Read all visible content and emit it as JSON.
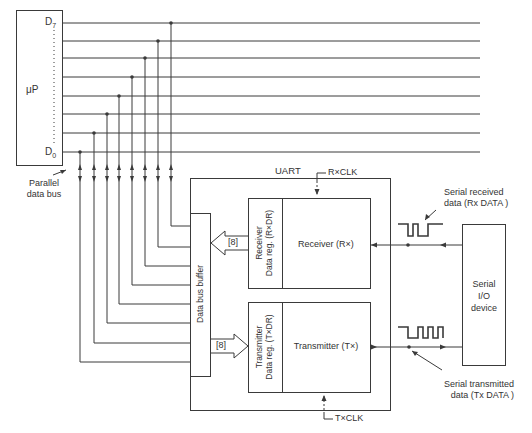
{
  "microprocessor": {
    "label": "μP",
    "pin_top": "D",
    "pin_top_sub": "7",
    "pin_bottom": "D",
    "pin_bottom_sub": "0"
  },
  "bus": {
    "lines": [
      "D7",
      "D6",
      "D5",
      "D4",
      "D3",
      "D2",
      "D1",
      "D0"
    ],
    "label_line1": "Parallel",
    "label_line2": "data bus"
  },
  "uart": {
    "title": "UART",
    "rx_clock": "R×CLK",
    "tx_clock": "T×CLK",
    "data_bus_buffer": "Data bus buffer",
    "rx_width": "[8]",
    "tx_width": "[8]",
    "rxdr_line1": "Receiver",
    "rxdr_line2": "Data reg. (R×DR)",
    "txdr_line1": "Transmitter",
    "txdr_line2": "Data reg. (T×DR)",
    "receiver": "Receiver (R×)",
    "transmitter": "Transmitter (T×)"
  },
  "serial_device": {
    "line1": "Serial",
    "line2": "I/O",
    "line3": "device"
  },
  "signals": {
    "rx_line1": "Serial received",
    "rx_line2": "data (Rx DATA )",
    "tx_line1": "Serial transmitted",
    "tx_line2": "data (Tx DATA )"
  },
  "colors": {
    "line": "#333333",
    "background": "#ffffff"
  }
}
